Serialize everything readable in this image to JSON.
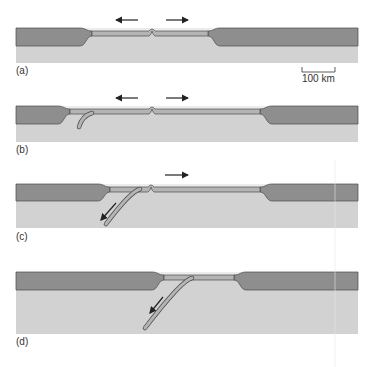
{
  "figure": {
    "colors": {
      "continental_crust": "#8e8e8e",
      "mantle": "#d2d2d2",
      "ocean_water": "#ececec",
      "oceanic_plate": "#b4b4b4",
      "outline": "#4a4a4a",
      "arrow": "#222222"
    },
    "scale_bar": {
      "label": "100 km",
      "x1": 302,
      "x2": 335,
      "y": 72
    },
    "panels": [
      {
        "label": "(a)",
        "label_y": 74,
        "top": 28,
        "crust_bottom": 46,
        "bottom": 63,
        "left_cont_end": 80,
        "right_cont_start": 220,
        "ridge_x": 152,
        "arrows": [
          {
            "x1": 138,
            "y1": 20,
            "x2": 116,
            "y2": 20
          },
          {
            "x1": 166,
            "y1": 20,
            "x2": 188,
            "y2": 20
          }
        ],
        "slab": null
      },
      {
        "label": "(b)",
        "label_y": 153,
        "top": 106,
        "crust_bottom": 124,
        "bottom": 142,
        "left_cont_end": 58,
        "right_cont_start": 272,
        "ridge_x": 152,
        "arrows": [
          {
            "x1": 138,
            "y1": 98,
            "x2": 116,
            "y2": 98
          },
          {
            "x1": 166,
            "y1": 98,
            "x2": 188,
            "y2": 98
          }
        ],
        "slab": {
          "x1": 92,
          "y1": 113,
          "cx": 82,
          "cy": 116,
          "x2": 79,
          "y2": 127
        }
      },
      {
        "label": "(c)",
        "label_y": 240,
        "top": 184,
        "crust_bottom": 201,
        "bottom": 228,
        "left_cont_end": 98,
        "right_cont_start": 272,
        "ridge_x": 151,
        "arrows": [
          {
            "x1": 165,
            "y1": 175,
            "x2": 188,
            "y2": 175
          },
          {
            "x1": 116,
            "y1": 203,
            "x2": 101,
            "y2": 220
          }
        ],
        "slab": {
          "x1": 140,
          "y1": 189,
          "cx": 130,
          "cy": 192,
          "x2": 106,
          "y2": 224
        }
      },
      {
        "label": "(d)",
        "label_y": 345,
        "top": 272,
        "crust_bottom": 290,
        "bottom": 334,
        "left_cont_end": 152,
        "right_cont_start": 246,
        "ridge_x": null,
        "arrows": [
          {
            "x1": 163,
            "y1": 297,
            "x2": 150,
            "y2": 313
          }
        ],
        "slab": {
          "x1": 192,
          "y1": 278,
          "cx": 182,
          "cy": 280,
          "x2": 145,
          "y2": 328
        }
      }
    ]
  }
}
